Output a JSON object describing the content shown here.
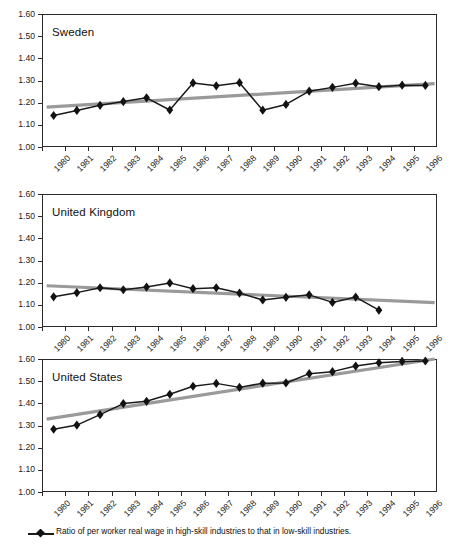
{
  "chart_data": {
    "type": "line",
    "title": "",
    "xlabel": "",
    "ylabel": "",
    "ylim": [
      1.0,
      1.6
    ],
    "xlim": [
      1980,
      1997
    ],
    "ytick_labels": [
      "1.60",
      "1.50",
      "1.40",
      "1.30",
      "1.20",
      "1.10",
      "1.00"
    ],
    "ytick_values": [
      1.6,
      1.5,
      1.4,
      1.3,
      1.2,
      1.1,
      1.0
    ],
    "xtick_labels": [
      "1980",
      "1981",
      "1982",
      "1983",
      "1984",
      "1985",
      "1986",
      "1987",
      "1988",
      "1989",
      "1990",
      "1991",
      "1992",
      "1993",
      "1994",
      "1995",
      "1996"
    ],
    "xtick_values": [
      1980,
      1981,
      1982,
      1983,
      1984,
      1985,
      1986,
      1987,
      1988,
      1989,
      1990,
      1991,
      1992,
      1993,
      1994,
      1995,
      1996
    ],
    "grid": false,
    "legend_position": "bottom",
    "legend": [
      {
        "label": "Ratio of per worker real wage in high-skill industries to that in low-skill industries.",
        "marker": "diamond",
        "color": "#121212"
      }
    ],
    "marker_color": "#121212",
    "series_line_color": "#1a1a1a",
    "trend_line_color": "#9a9a9a",
    "panels": [
      {
        "name": "sweden",
        "label": "Sweden",
        "x": [
          1980.5,
          1981.5,
          1982.5,
          1983.5,
          1984.5,
          1985.5,
          1986.5,
          1987.5,
          1988.5,
          1989.5,
          1990.5,
          1991.5,
          1992.5,
          1993.5,
          1994.5,
          1995.5,
          1996.5
        ],
        "values": [
          1.142,
          1.165,
          1.188,
          1.205,
          1.222,
          1.167,
          1.289,
          1.276,
          1.29,
          1.166,
          1.192,
          1.252,
          1.269,
          1.288,
          1.272,
          1.279,
          1.278
        ],
        "trend": {
          "x0": 1980.2,
          "y0": 1.18,
          "x1": 1996.9,
          "y1": 1.286
        }
      },
      {
        "name": "united_kingdom",
        "label": "United Kingdom",
        "x": [
          1980.5,
          1981.5,
          1982.5,
          1983.5,
          1984.5,
          1985.5,
          1986.5,
          1987.5,
          1988.5,
          1989.5,
          1990.5,
          1991.5,
          1992.5,
          1993.5,
          1994.5
        ],
        "values": [
          1.136,
          1.155,
          1.177,
          1.168,
          1.18,
          1.199,
          1.173,
          1.177,
          1.153,
          1.122,
          1.134,
          1.145,
          1.111,
          1.135,
          1.076
        ],
        "trend": {
          "x0": 1980.2,
          "y0": 1.186,
          "x1": 1996.9,
          "y1": 1.11
        }
      },
      {
        "name": "united_states",
        "label": "United States",
        "x": [
          1980.5,
          1981.5,
          1982.5,
          1983.5,
          1984.5,
          1985.5,
          1986.5,
          1987.5,
          1988.5,
          1989.5,
          1990.5,
          1991.5,
          1992.5,
          1993.5,
          1994.5,
          1995.5,
          1996.5
        ],
        "values": [
          1.283,
          1.302,
          1.349,
          1.399,
          1.409,
          1.441,
          1.477,
          1.49,
          1.472,
          1.491,
          1.492,
          1.534,
          1.543,
          1.568,
          1.583,
          1.589,
          1.591
        ],
        "trend": {
          "x0": 1980.2,
          "y0": 1.329,
          "x1": 1996.9,
          "y1": 1.6
        }
      }
    ]
  }
}
